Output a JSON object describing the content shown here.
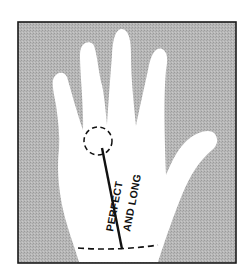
{
  "diagram": {
    "colors": {
      "background": "#ffffff",
      "frame_fill": "#b4b4b4",
      "frame_border": "#1a1a1a",
      "hand": "#ffffff",
      "line": "#111111"
    },
    "labels": {
      "line1": "PERFECT",
      "line2": "AND LONG"
    },
    "markers": {
      "circle": "dashed circle at base of fingers",
      "solid_line": "line from circle to wrist",
      "wrist_line": "dashed wrist line"
    }
  }
}
